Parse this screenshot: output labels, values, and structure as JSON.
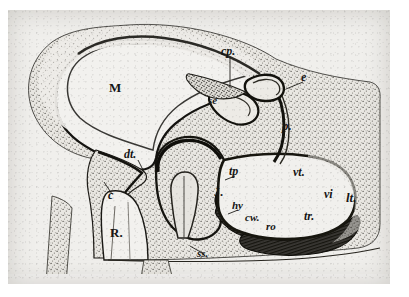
{
  "figure": {
    "kind": "anatomical-section-illustration",
    "background_color": "#f0efec",
    "ink_color": "#1a1a1a",
    "tissue_fill": "#e8e6e1",
    "plate_border_color": "#d8d6d0",
    "labels": [
      {
        "id": "M",
        "text": "M",
        "style": "roman",
        "size": 13,
        "x": 101,
        "y": 78
      },
      {
        "id": "cp",
        "text": "cp.",
        "style": "italic",
        "size": 11,
        "x": 219,
        "y": 43
      },
      {
        "id": "e",
        "text": "e",
        "style": "italic",
        "size": 11,
        "x": 297,
        "y": 69
      },
      {
        "id": "se",
        "text": "se",
        "style": "italic",
        "size": 10,
        "x": 208,
        "y": 93
      },
      {
        "id": "p",
        "text": "p.",
        "style": "italic",
        "size": 12,
        "x": 281,
        "y": 117
      },
      {
        "id": "dt",
        "text": "dt.",
        "style": "italic",
        "size": 11,
        "x": 124,
        "y": 146
      },
      {
        "id": "c",
        "text": "c",
        "style": "italic",
        "size": 11,
        "x": 106,
        "y": 186
      },
      {
        "id": "R",
        "text": "R.",
        "style": "roman",
        "size": 13,
        "x": 110,
        "y": 224
      },
      {
        "id": "tp",
        "text": "tp",
        "style": "italic",
        "size": 11,
        "x": 228,
        "y": 163
      },
      {
        "id": "J",
        "text": "J.",
        "style": "roman",
        "size": 12,
        "x": 213,
        "y": 184
      },
      {
        "id": "hy",
        "text": "hy",
        "style": "italic",
        "size": 10,
        "x": 231,
        "y": 198
      },
      {
        "id": "cw",
        "text": "cw.",
        "style": "italic",
        "size": 10,
        "x": 244,
        "y": 210
      },
      {
        "id": "ro",
        "text": "ro",
        "style": "italic",
        "size": 10,
        "x": 265,
        "y": 219
      },
      {
        "id": "ss",
        "text": "ss.",
        "style": "italic",
        "size": 10,
        "x": 196,
        "y": 246
      },
      {
        "id": "vt",
        "text": "vt.",
        "style": "italic",
        "size": 11,
        "x": 292,
        "y": 164
      },
      {
        "id": "vi",
        "text": "vi",
        "style": "italic",
        "size": 11,
        "x": 323,
        "y": 186
      },
      {
        "id": "lt",
        "text": "lt.",
        "style": "italic",
        "size": 12,
        "x": 345,
        "y": 190
      },
      {
        "id": "tr",
        "text": "tr.",
        "style": "italic",
        "size": 11,
        "x": 303,
        "y": 208
      }
    ]
  }
}
